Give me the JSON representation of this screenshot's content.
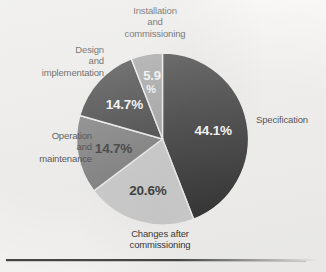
{
  "figure": {
    "background_color": "#f4f3f1",
    "rule_color": "#2b2b2b"
  },
  "chart_data": {
    "type": "pie",
    "title": "",
    "subtitle": "",
    "xlabel": "",
    "ylabel": "",
    "legend_position": "callout-labels",
    "grid": false,
    "value_unit": "%",
    "total": 100,
    "start_angle_deg": 0,
    "direction": "clockwise",
    "categories": [
      "Specification",
      "Changes after commissioning",
      "Operation and maintenance",
      "Design and implementation",
      "Installation and commissioning"
    ],
    "values": [
      44.1,
      20.6,
      14.7,
      14.7,
      5.9
    ],
    "value_labels": [
      "44.1%",
      "20.6%",
      "14.7%",
      "14.7%",
      "5.9\n%"
    ],
    "colors": [
      "#1c1c1c",
      "#c9c9c9",
      "#6e6e6e",
      "#262626",
      "#9a9a9a"
    ],
    "label_text_colors": [
      "#ffffff",
      "#1a1a1a",
      "#141414",
      "#ffffff",
      "#ffffff"
    ],
    "slices": [
      {
        "name": "Specification",
        "value": 44.1,
        "value_label": "44.1%",
        "color": "#1c1c1c",
        "label_color": "#ffffff",
        "start_deg": 0,
        "end_deg": 158.76
      },
      {
        "name": "Changes after commissioning",
        "value": 20.6,
        "value_label": "20.6%",
        "color": "#c9c9c9",
        "label_color": "#1a1a1a",
        "start_deg": 158.76,
        "end_deg": 232.92
      },
      {
        "name": "Operation and maintenance",
        "value": 14.7,
        "value_label": "14.7%",
        "color": "#6e6e6e",
        "label_color": "#141414",
        "start_deg": 232.92,
        "end_deg": 285.84
      },
      {
        "name": "Design and implementation",
        "value": 14.7,
        "value_label": "14.7%",
        "color": "#262626",
        "label_color": "#ffffff",
        "start_deg": 285.84,
        "end_deg": 338.76
      },
      {
        "name": "Installation and commissioning",
        "value": 5.9,
        "value_label_line1": "5.9",
        "value_label_line2": "%",
        "color": "#9a9a9a",
        "label_color": "#ffffff",
        "start_deg": 338.76,
        "end_deg": 360
      }
    ]
  },
  "callouts": {
    "installation": "Installation\nand\ncommissioning",
    "design": "Design\nand\nimplementation",
    "operation": "Operation\nand\nmaintenance",
    "changes": "Changes after\ncommissioning",
    "specification": "Specification"
  }
}
